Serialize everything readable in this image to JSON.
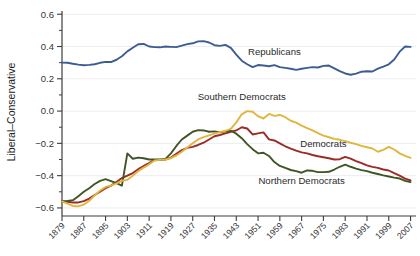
{
  "chart_data": {
    "type": "line",
    "title": "",
    "xlabel": "",
    "ylabel": "Liberal–Conservative",
    "xlim": [
      1879,
      2009
    ],
    "ylim": [
      -0.65,
      0.62
    ],
    "grid": true,
    "legend_position": "inline-annotations",
    "xtick_labels": [
      "1879",
      "1887",
      "1895",
      "1903",
      "1911",
      "1919",
      "1927",
      "1935",
      "1943",
      "1951",
      "1959",
      "1967",
      "1975",
      "1983",
      "1991",
      "1999",
      "2007"
    ],
    "xtick_values": [
      1879,
      1887,
      1895,
      1903,
      1911,
      1919,
      1927,
      1935,
      1943,
      1951,
      1959,
      1967,
      1975,
      1983,
      1991,
      1999,
      2007
    ],
    "ytick_labels": [
      "0.6",
      "0.4",
      "0.2",
      "0.0",
      "−0.2",
      "−0.4",
      "−0.6"
    ],
    "ytick_values": [
      0.6,
      0.4,
      0.2,
      0.0,
      -0.2,
      -0.4,
      -0.6
    ],
    "yminor_values": [
      0.5,
      0.3,
      0.1,
      -0.1,
      -0.3,
      -0.5
    ],
    "series": [
      {
        "name": "Republicans",
        "color": "#3d5c93",
        "annotation": "Republicans",
        "annotation_x": 1957,
        "annotation_y": 0.345,
        "x": [
          1879,
          1881,
          1883,
          1885,
          1887,
          1889,
          1891,
          1893,
          1895,
          1897,
          1899,
          1901,
          1903,
          1905,
          1907,
          1909,
          1911,
          1913,
          1915,
          1917,
          1919,
          1921,
          1923,
          1925,
          1927,
          1929,
          1931,
          1933,
          1935,
          1937,
          1939,
          1941,
          1943,
          1945,
          1947,
          1949,
          1951,
          1953,
          1955,
          1957,
          1959,
          1961,
          1963,
          1965,
          1967,
          1969,
          1971,
          1973,
          1975,
          1977,
          1979,
          1981,
          1983,
          1985,
          1987,
          1989,
          1991,
          1993,
          1995,
          1997,
          1999,
          2001,
          2003,
          2005,
          2007
        ],
        "y": [
          0.3,
          0.299,
          0.293,
          0.288,
          0.284,
          0.286,
          0.29,
          0.299,
          0.305,
          0.304,
          0.318,
          0.34,
          0.37,
          0.392,
          0.414,
          0.416,
          0.4,
          0.396,
          0.395,
          0.4,
          0.398,
          0.396,
          0.405,
          0.415,
          0.42,
          0.432,
          0.433,
          0.425,
          0.408,
          0.404,
          0.41,
          0.392,
          0.35,
          0.312,
          0.29,
          0.272,
          0.285,
          0.282,
          0.278,
          0.285,
          0.272,
          0.268,
          0.262,
          0.255,
          0.262,
          0.268,
          0.272,
          0.27,
          0.28,
          0.282,
          0.265,
          0.248,
          0.233,
          0.225,
          0.232,
          0.244,
          0.247,
          0.245,
          0.263,
          0.276,
          0.29,
          0.32,
          0.368,
          0.4,
          0.398
        ]
      },
      {
        "name": "Democrats",
        "color": "#9c2b25",
        "annotation": "Democrats",
        "annotation_x": 1975,
        "annotation_y": -0.225,
        "x": [
          1879,
          1881,
          1883,
          1885,
          1887,
          1889,
          1891,
          1893,
          1895,
          1897,
          1899,
          1901,
          1903,
          1905,
          1907,
          1909,
          1911,
          1913,
          1915,
          1917,
          1919,
          1921,
          1923,
          1925,
          1927,
          1929,
          1931,
          1933,
          1935,
          1937,
          1939,
          1941,
          1943,
          1945,
          1947,
          1949,
          1951,
          1953,
          1955,
          1957,
          1959,
          1961,
          1963,
          1965,
          1967,
          1969,
          1971,
          1973,
          1975,
          1977,
          1979,
          1981,
          1983,
          1985,
          1987,
          1989,
          1991,
          1993,
          1995,
          1997,
          1999,
          2001,
          2003,
          2005,
          2007
        ],
        "y": [
          -0.56,
          -0.562,
          -0.566,
          -0.566,
          -0.558,
          -0.542,
          -0.52,
          -0.5,
          -0.478,
          -0.462,
          -0.44,
          -0.415,
          -0.4,
          -0.384,
          -0.36,
          -0.34,
          -0.322,
          -0.302,
          -0.302,
          -0.3,
          -0.288,
          -0.265,
          -0.242,
          -0.228,
          -0.222,
          -0.21,
          -0.196,
          -0.176,
          -0.156,
          -0.148,
          -0.138,
          -0.128,
          -0.12,
          -0.1,
          -0.108,
          -0.145,
          -0.138,
          -0.132,
          -0.175,
          -0.182,
          -0.2,
          -0.218,
          -0.232,
          -0.245,
          -0.256,
          -0.262,
          -0.272,
          -0.28,
          -0.286,
          -0.292,
          -0.3,
          -0.298,
          -0.284,
          -0.295,
          -0.31,
          -0.322,
          -0.336,
          -0.346,
          -0.352,
          -0.362,
          -0.368,
          -0.385,
          -0.4,
          -0.418,
          -0.43
        ]
      },
      {
        "name": "Northern Democrats",
        "color": "#3f5526",
        "annotation": "Northern Democrats",
        "annotation_x": 1967,
        "annotation_y": -0.452,
        "x": [
          1879,
          1881,
          1883,
          1885,
          1887,
          1889,
          1891,
          1893,
          1895,
          1897,
          1899,
          1901,
          1903,
          1905,
          1907,
          1909,
          1911,
          1913,
          1915,
          1917,
          1919,
          1921,
          1923,
          1925,
          1927,
          1929,
          1931,
          1933,
          1935,
          1937,
          1939,
          1941,
          1943,
          1945,
          1947,
          1949,
          1951,
          1953,
          1955,
          1957,
          1959,
          1961,
          1963,
          1965,
          1967,
          1969,
          1971,
          1973,
          1975,
          1977,
          1979,
          1981,
          1983,
          1985,
          1987,
          1989,
          1991,
          1993,
          1995,
          1997,
          1999,
          2001,
          2003,
          2005,
          2007
        ],
        "y": [
          -0.558,
          -0.556,
          -0.552,
          -0.528,
          -0.5,
          -0.478,
          -0.452,
          -0.432,
          -0.422,
          -0.434,
          -0.446,
          -0.462,
          -0.262,
          -0.295,
          -0.288,
          -0.292,
          -0.3,
          -0.3,
          -0.3,
          -0.296,
          -0.262,
          -0.216,
          -0.176,
          -0.152,
          -0.128,
          -0.118,
          -0.12,
          -0.128,
          -0.126,
          -0.132,
          -0.126,
          -0.122,
          -0.14,
          -0.168,
          -0.205,
          -0.236,
          -0.262,
          -0.258,
          -0.278,
          -0.316,
          -0.34,
          -0.352,
          -0.365,
          -0.372,
          -0.382,
          -0.368,
          -0.37,
          -0.378,
          -0.378,
          -0.376,
          -0.362,
          -0.345,
          -0.332,
          -0.345,
          -0.356,
          -0.366,
          -0.372,
          -0.382,
          -0.39,
          -0.398,
          -0.405,
          -0.412,
          -0.418,
          -0.432,
          -0.44
        ]
      },
      {
        "name": "Southern Democrats",
        "color": "#e0b63e",
        "annotation": "Southern Democrats",
        "annotation_x": 1945,
        "annotation_y": 0.068,
        "x": [
          1879,
          1881,
          1883,
          1885,
          1887,
          1889,
          1891,
          1893,
          1895,
          1897,
          1899,
          1901,
          1903,
          1905,
          1907,
          1909,
          1911,
          1913,
          1915,
          1917,
          1919,
          1921,
          1923,
          1925,
          1927,
          1929,
          1931,
          1933,
          1935,
          1937,
          1939,
          1941,
          1943,
          1945,
          1947,
          1949,
          1951,
          1953,
          1955,
          1957,
          1959,
          1961,
          1963,
          1965,
          1967,
          1969,
          1971,
          1973,
          1975,
          1977,
          1979,
          1981,
          1983,
          1985,
          1987,
          1989,
          1991,
          1993,
          1995,
          1997,
          1999,
          2001,
          2003,
          2005,
          2007
        ],
        "y": [
          -0.56,
          -0.574,
          -0.588,
          -0.59,
          -0.58,
          -0.556,
          -0.522,
          -0.492,
          -0.47,
          -0.462,
          -0.448,
          -0.432,
          -0.426,
          -0.4,
          -0.372,
          -0.35,
          -0.33,
          -0.306,
          -0.302,
          -0.3,
          -0.292,
          -0.275,
          -0.252,
          -0.225,
          -0.2,
          -0.176,
          -0.162,
          -0.15,
          -0.14,
          -0.13,
          -0.122,
          -0.11,
          -0.07,
          -0.02,
          0.0,
          -0.004,
          -0.032,
          -0.046,
          -0.018,
          -0.03,
          -0.024,
          -0.038,
          -0.06,
          -0.072,
          -0.09,
          -0.105,
          -0.12,
          -0.136,
          -0.152,
          -0.162,
          -0.172,
          -0.178,
          -0.186,
          -0.196,
          -0.205,
          -0.216,
          -0.224,
          -0.232,
          -0.252,
          -0.24,
          -0.222,
          -0.238,
          -0.262,
          -0.278,
          -0.29
        ]
      }
    ]
  },
  "axes": {
    "y_axis_title": "Liberal–Conservative"
  }
}
